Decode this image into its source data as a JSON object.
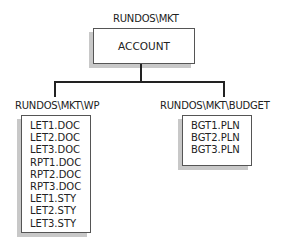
{
  "root": {
    "path": "RUNDOS\\MKT",
    "name": "ACCOUNT"
  },
  "children": [
    {
      "path": "RUNDOS\\MKT\\WP",
      "files": [
        "LET1.DOC",
        "LET2.DOC",
        "LET3.DOC",
        "RPT1.DOC",
        "RPT2.DOC",
        "RPT3.DOC",
        "LET1.STY",
        "LET2.STY",
        "LET3.STY"
      ]
    },
    {
      "path": "RUNDOS\\MKT\\BUDGET",
      "files": [
        "BGT1.PLN",
        "BGT2.PLN",
        "BGT3.PLN"
      ]
    }
  ]
}
